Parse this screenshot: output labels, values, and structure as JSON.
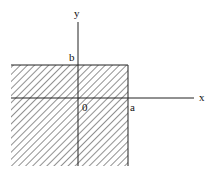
{
  "diagram": {
    "labels": {
      "y_axis": "y",
      "x_axis": "x",
      "b": "b",
      "a": "a",
      "origin": "0"
    },
    "region": {
      "description": "hatched region x <= a, y <= b",
      "hatch_color": "#555555"
    },
    "axis_color": "#222222"
  }
}
